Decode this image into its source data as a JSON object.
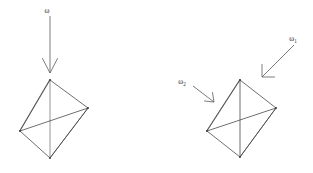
{
  "figure": {
    "background_color": "#ffffff",
    "stroke_color": "#4a4a4a",
    "label_color": "#2b2b2b",
    "width": 313,
    "height": 173
  },
  "panels": [
    {
      "id": "left-panel",
      "name": "single-incident-vector",
      "arrows": [
        {
          "id": "arrow-omega",
          "label": "ω",
          "subscript": "",
          "direction": "downward-vertical",
          "from": [
            50,
            15
          ],
          "to": [
            50,
            72
          ],
          "label_position": [
            47,
            11
          ]
        }
      ],
      "polyhedron": {
        "id": "octahedron-left",
        "name": "octahedron",
        "vertices": {
          "top": [
            50,
            80
          ],
          "right": [
            88,
            108
          ],
          "left": [
            20,
            131
          ],
          "bottom": [
            50,
            158
          ]
        }
      }
    },
    {
      "id": "right-panel",
      "name": "two-incident-vectors",
      "arrows": [
        {
          "id": "arrow-omega-1",
          "label": "ω",
          "subscript": "1",
          "direction": "upper-right-to-lower-left",
          "from": [
            294,
            45
          ],
          "to": [
            261,
            78
          ],
          "label_position": [
            293,
            40
          ]
        },
        {
          "id": "arrow-omega-2",
          "label": "ω",
          "subscript": "2",
          "direction": "upper-left-to-lower-right",
          "from": [
            193,
            86
          ],
          "to": [
            214,
            102
          ],
          "label_position": [
            180,
            84
          ]
        }
      ],
      "polyhedron": {
        "id": "octahedron-right",
        "name": "octahedron",
        "vertices": {
          "top": [
            240,
            80
          ],
          "right": [
            276,
            108
          ],
          "left": [
            207,
            131
          ],
          "bottom": [
            240,
            157
          ]
        }
      }
    }
  ],
  "labels": {
    "omega": "ω",
    "omega_1_base": "ω",
    "omega_1_sub": "1",
    "omega_2_base": "ω",
    "omega_2_sub": "2"
  }
}
